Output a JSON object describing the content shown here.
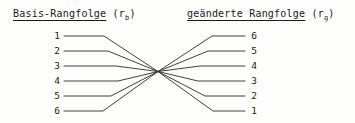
{
  "diagram": {
    "background_color": "#fdfdfb",
    "line_color": "#2b2b2b",
    "text_color": "#1a1a1a",
    "headers": {
      "left": {
        "underlined_text": "Basis-Rangfolge",
        "symbol_open": " (r",
        "symbol_subscript": "b",
        "symbol_close": ")"
      },
      "right": {
        "underlined_text": "geänderte Rangfolge",
        "symbol_open": " (r",
        "symbol_subscript": "g",
        "symbol_close": ")"
      }
    },
    "left_column": {
      "label": "Basis-Rangfolge",
      "values": [
        "1",
        "2",
        "3",
        "4",
        "5",
        "6"
      ]
    },
    "right_column": {
      "label": "geänderte Rangfolge",
      "values": [
        "6",
        "5",
        "4",
        "3",
        "2",
        "1"
      ]
    },
    "mapping": [
      {
        "from": "1",
        "to": "6"
      },
      {
        "from": "2",
        "to": "5"
      },
      {
        "from": "3",
        "to": "4"
      },
      {
        "from": "4",
        "to": "3"
      },
      {
        "from": "5",
        "to": "2"
      },
      {
        "from": "6",
        "to": "1"
      }
    ],
    "geometry": {
      "row_y": [
        36,
        51,
        66,
        81,
        96,
        111
      ],
      "left_line_start_x": 64,
      "right_line_end_x": 245,
      "left_bend_x": [
        104,
        108,
        116,
        118,
        111,
        103
      ],
      "right_bend_x": [
        212,
        208,
        200,
        198,
        205,
        213
      ],
      "crossing_x": 158,
      "crossing_y": 71.5
    }
  }
}
